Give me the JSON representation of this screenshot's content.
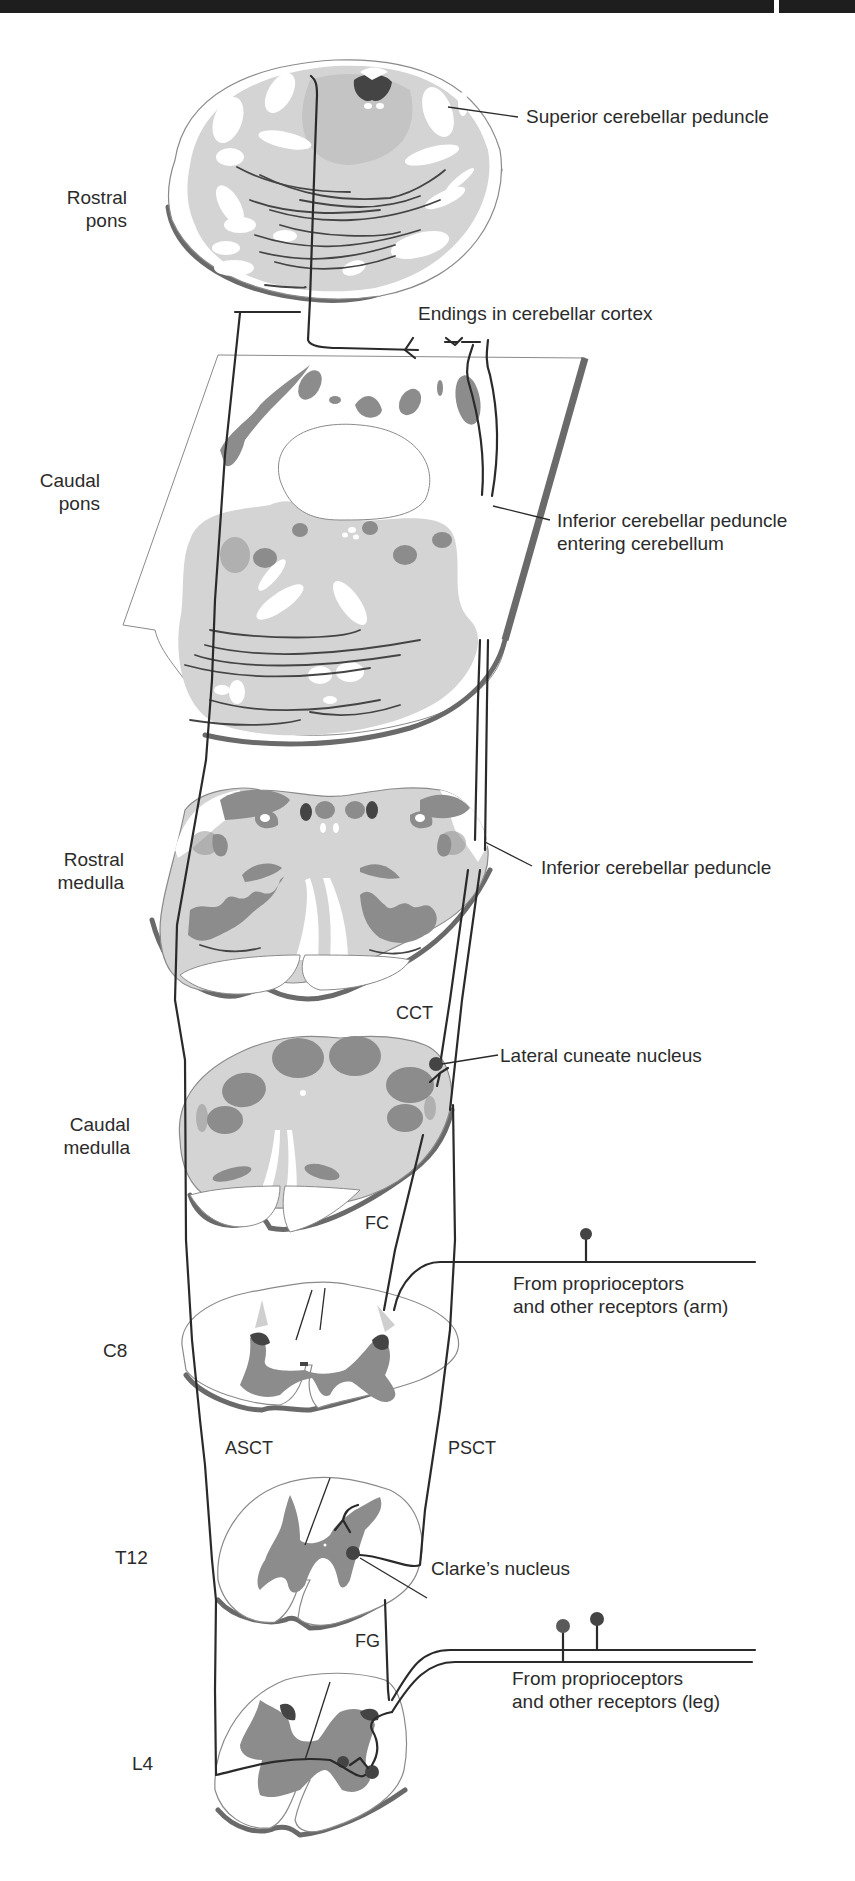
{
  "figure": {
    "colors": {
      "background": "#ffffff",
      "top_bar": "#1e1e1e",
      "light_gray_tissue": "#d4d4d4",
      "mid_gray_nuclei": "#8c8c8c",
      "dark_gray_nuclei": "#444444",
      "section_shadow": "#6a6a6a",
      "pathway_line": "#2a2a2a",
      "label_text": "#2b2b2b"
    }
  },
  "levels": [
    {
      "id": "rostral-pons",
      "label_line1": "Rostral",
      "label_line2": "pons"
    },
    {
      "id": "caudal-pons",
      "label_line1": "Caudal",
      "label_line2": "pons"
    },
    {
      "id": "rostral-medulla",
      "label_line1": "Rostral",
      "label_line2": "medulla"
    },
    {
      "id": "caudal-medulla",
      "label_line1": "Caudal",
      "label_line2": "medulla"
    },
    {
      "id": "c8",
      "label_line1": "C8"
    },
    {
      "id": "t12",
      "label_line1": "T12"
    },
    {
      "id": "l4",
      "label_line1": "L4"
    }
  ],
  "annotations": {
    "superior_cerebellar_peduncle": "Superior cerebellar peduncle",
    "endings_in_cerebellar_cortex": "Endings in cerebellar cortex",
    "icp_entering_line1": "Inferior cerebellar peduncle",
    "icp_entering_line2": "entering cerebellum",
    "inferior_cerebellar_peduncle": "Inferior cerebellar peduncle",
    "lateral_cuneate_nucleus": "Lateral cuneate nucleus",
    "clarkes_nucleus": "Clarke’s nucleus",
    "arm_input_line1": "From proprioceptors",
    "arm_input_line2": "and other receptors (arm)",
    "leg_input_line1": "From proprioceptors",
    "leg_input_line2": "and other receptors (leg)"
  },
  "tract_abbreviations": {
    "cct": "CCT",
    "fc": "FC",
    "asct": "ASCT",
    "psct": "PSCT",
    "fg": "FG"
  }
}
